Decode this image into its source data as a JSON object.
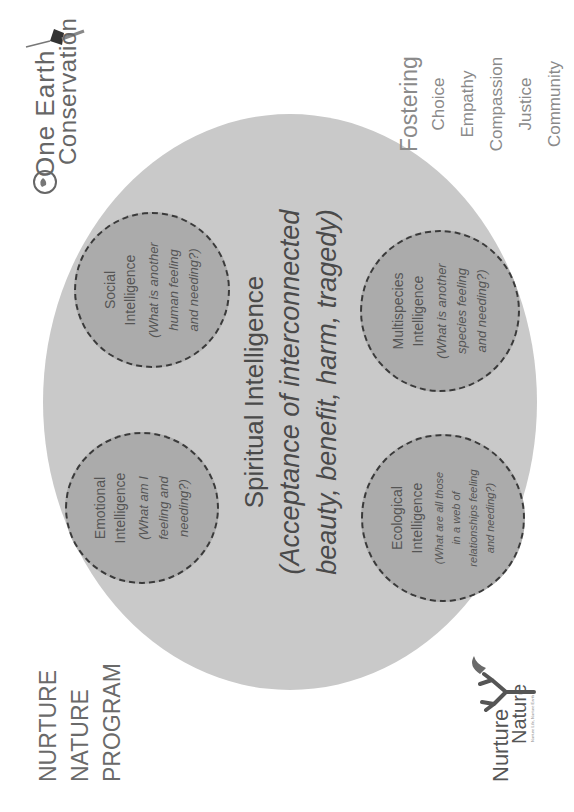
{
  "program": {
    "lines": [
      "NURTURE",
      "NATURE",
      "PROGRAM"
    ]
  },
  "logos": {
    "one_earth": {
      "line1": "One Earth",
      "line2": "Conservation",
      "icon": "hummingbird-globe-icon"
    },
    "nurture_nature": {
      "word1": "Nurture",
      "word2": "Nature",
      "tagline": "Nurture Life, Nurture Earth",
      "icon": "tree-bird-icon"
    }
  },
  "fostering": {
    "heading": "Fostering",
    "items": [
      "Choice",
      "Empathy",
      "Compassion",
      "Justice",
      "Community"
    ]
  },
  "diagram": {
    "center": {
      "title": "Spiritual Intelligence",
      "desc_line1": "(Acceptance of  interconnected",
      "desc_line2": "beauty, benefit, harm, tragedy)"
    },
    "circles": [
      {
        "id": "emotional",
        "title_line1": "Emotional",
        "title_line2": "Intelligence",
        "question": [
          "(What am I",
          "feeling and",
          "needing?)"
        ]
      },
      {
        "id": "social",
        "title_line1": "Social",
        "title_line2": "Intelligence",
        "question": [
          "(What is another",
          "human feeling",
          "and needing?)"
        ]
      },
      {
        "id": "ecological",
        "title_line1": "Ecological",
        "title_line2": "Intelligence",
        "question": [
          "(What are all those",
          "in a web of",
          "relationships feeling",
          "and needing?)"
        ]
      },
      {
        "id": "multispecies",
        "title_line1": "Multispecies",
        "title_line2": "Intelligence",
        "question": [
          "(What is another",
          "species feeling",
          "and needing?)"
        ]
      }
    ]
  },
  "colors": {
    "outer_circle": "#c9c9c9",
    "inner_circle": "#ababab",
    "dashed_border": "#3a3a3a",
    "text_dark": "#4a4a4a",
    "text_light": "#8a8a8a"
  }
}
